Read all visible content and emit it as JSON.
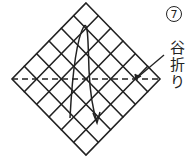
{
  "diagram": {
    "step_number": "7",
    "fold_label_chars": [
      "谷",
      "折",
      "り"
    ],
    "fold_label": "谷折り",
    "fold_type": "valley fold",
    "grid_divisions": 6,
    "stroke_color": "#222222"
  }
}
